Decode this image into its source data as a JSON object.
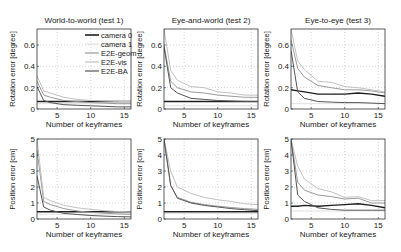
{
  "legend": {
    "entries": [
      {
        "label": "camera 0",
        "color": "#1e1e1e",
        "width": 1.4
      },
      {
        "label": "camera 1",
        "color": "#e0e0e0",
        "width": 1.0
      },
      {
        "label": "E2E-geom",
        "color": "#9a9a9a",
        "width": 1.0
      },
      {
        "label": "E2E-vis",
        "color": "#c2c2c2",
        "width": 1.0
      },
      {
        "label": "E2E-BA",
        "color": "#555555",
        "width": 1.0
      }
    ]
  },
  "chart_data": [
    {
      "type": "line",
      "title": "World-to-world (test 1)",
      "xlabel": "Number of keyframes",
      "ylabel": "Rotation error [degree]",
      "xlim": [
        2,
        16
      ],
      "ylim": [
        0,
        0.75
      ],
      "xticks": [
        5,
        10,
        15
      ],
      "yticks": [
        0,
        0.2,
        0.4,
        0.6
      ],
      "ytick_labels": [
        "0",
        "0.2",
        "0.4",
        "0.6"
      ],
      "grid": true,
      "legend_position": "upper right",
      "x": [
        2,
        3,
        4,
        6,
        8,
        10,
        12,
        14,
        16
      ],
      "series": [
        {
          "name": "camera 0",
          "values": [
            0.07,
            0.07,
            0.07,
            0.07,
            0.07,
            0.07,
            0.07,
            0.07,
            0.07
          ]
        },
        {
          "name": "camera 1",
          "values": [
            0.05,
            0.05,
            0.05,
            0.05,
            0.05,
            0.05,
            0.05,
            0.05,
            0.05
          ]
        },
        {
          "name": "E2E-geom",
          "values": [
            0.26,
            0.13,
            0.11,
            0.08,
            0.07,
            0.06,
            0.055,
            0.05,
            0.05
          ]
        },
        {
          "name": "E2E-vis",
          "values": [
            0.31,
            0.17,
            0.15,
            0.11,
            0.09,
            0.08,
            0.075,
            0.07,
            0.07
          ]
        },
        {
          "name": "E2E-BA",
          "values": [
            0.21,
            0.08,
            0.06,
            0.04,
            0.035,
            0.03,
            0.025,
            0.02,
            0.02
          ]
        }
      ]
    },
    {
      "type": "line",
      "title": "Eye-and-world (test 2)",
      "xlabel": "Number of keyframes",
      "ylabel": "Rotation error [degree]",
      "xlim": [
        2,
        16
      ],
      "ylim": [
        0,
        0.75
      ],
      "xticks": [
        5,
        10,
        15
      ],
      "yticks": [
        0,
        0.2,
        0.4,
        0.6
      ],
      "ytick_labels": [
        "0",
        "0.2",
        "0.4",
        "0.6"
      ],
      "grid": true,
      "x": [
        2,
        3,
        4,
        6,
        8,
        10,
        12,
        14,
        16
      ],
      "series": [
        {
          "name": "camera 0",
          "values": [
            0.07,
            0.07,
            0.07,
            0.07,
            0.07,
            0.07,
            0.07,
            0.07,
            0.07
          ]
        },
        {
          "name": "camera 1",
          "values": [
            0.03,
            0.03,
            0.03,
            0.03,
            0.03,
            0.03,
            0.03,
            0.03,
            0.03
          ]
        },
        {
          "name": "E2E-geom",
          "values": [
            0.6,
            0.26,
            0.2,
            0.16,
            0.15,
            0.13,
            0.12,
            0.11,
            0.11
          ]
        },
        {
          "name": "E2E-vis",
          "values": [
            0.75,
            0.36,
            0.27,
            0.21,
            0.2,
            0.16,
            0.15,
            0.13,
            0.13
          ]
        },
        {
          "name": "E2E-BA",
          "values": [
            0.58,
            0.2,
            0.15,
            0.1,
            0.09,
            0.08,
            0.075,
            0.07,
            0.07
          ]
        }
      ]
    },
    {
      "type": "line",
      "title": "Eye-to-eye (test 3)",
      "xlabel": "Number of keyframes",
      "ylabel": "Rotation error [degree]",
      "xlim": [
        2,
        16
      ],
      "ylim": [
        0,
        0.75
      ],
      "xticks": [
        5,
        10,
        15
      ],
      "yticks": [
        0,
        0.2,
        0.4,
        0.6
      ],
      "ytick_labels": [
        "0",
        "0.2",
        "0.4",
        "0.6"
      ],
      "grid": true,
      "x": [
        2,
        3,
        4,
        6,
        8,
        10,
        12,
        14,
        16
      ],
      "series": [
        {
          "name": "camera 0",
          "values": [
            0.18,
            0.17,
            0.16,
            0.14,
            0.14,
            0.14,
            0.15,
            0.14,
            0.12
          ]
        },
        {
          "name": "camera 1",
          "values": [
            0.05,
            0.05,
            0.05,
            0.05,
            0.05,
            0.05,
            0.05,
            0.05,
            0.05
          ]
        },
        {
          "name": "E2E-geom",
          "values": [
            0.65,
            0.38,
            0.3,
            0.22,
            0.2,
            0.18,
            0.18,
            0.17,
            0.15
          ]
        },
        {
          "name": "E2E-vis",
          "values": [
            0.75,
            0.45,
            0.37,
            0.26,
            0.25,
            0.21,
            0.2,
            0.18,
            0.16
          ]
        },
        {
          "name": "E2E-BA",
          "values": [
            0.55,
            0.16,
            0.1,
            0.07,
            0.065,
            0.06,
            0.06,
            0.055,
            0.05
          ]
        }
      ]
    },
    {
      "type": "line",
      "title": "",
      "xlabel": "Number of keyframes",
      "ylabel": "Position error [cm]",
      "xlim": [
        2,
        16
      ],
      "ylim": [
        0,
        5
      ],
      "xticks": [
        5,
        10,
        15
      ],
      "yticks": [
        0,
        1,
        2,
        3,
        4,
        5
      ],
      "ytick_labels": [
        "0",
        "1",
        "2",
        "3",
        "4",
        "5"
      ],
      "grid": true,
      "x": [
        2,
        3,
        4,
        6,
        8,
        10,
        12,
        14,
        16
      ],
      "series": [
        {
          "name": "camera 0",
          "values": [
            0.45,
            0.45,
            0.45,
            0.45,
            0.45,
            0.45,
            0.45,
            0.45,
            0.45
          ]
        },
        {
          "name": "camera 1",
          "values": [
            0.3,
            0.3,
            0.3,
            0.3,
            0.3,
            0.3,
            0.3,
            0.3,
            0.3
          ]
        },
        {
          "name": "E2E-geom",
          "values": [
            4.3,
            1.1,
            0.9,
            0.65,
            0.5,
            0.42,
            0.36,
            0.32,
            0.3
          ]
        },
        {
          "name": "E2E-vis",
          "values": [
            5.0,
            1.35,
            1.15,
            0.85,
            0.7,
            0.6,
            0.52,
            0.47,
            0.45
          ]
        },
        {
          "name": "E2E-BA",
          "values": [
            2.7,
            0.75,
            0.55,
            0.35,
            0.28,
            0.22,
            0.18,
            0.15,
            0.13
          ]
        }
      ]
    },
    {
      "type": "line",
      "title": "",
      "xlabel": "Number of keyframes",
      "ylabel": "Position error [cm]",
      "xlim": [
        2,
        16
      ],
      "ylim": [
        0,
        5
      ],
      "xticks": [
        5,
        10,
        15
      ],
      "yticks": [
        0,
        1,
        2,
        3,
        4,
        5
      ],
      "ytick_labels": [
        "0",
        "1",
        "2",
        "3",
        "4",
        "5"
      ],
      "grid": true,
      "x": [
        2,
        3,
        4,
        6,
        8,
        10,
        12,
        14,
        16
      ],
      "series": [
        {
          "name": "camera 0",
          "values": [
            0.45,
            0.45,
            0.45,
            0.45,
            0.45,
            0.45,
            0.45,
            0.45,
            0.45
          ]
        },
        {
          "name": "camera 1",
          "values": [
            0.35,
            0.35,
            0.35,
            0.35,
            0.35,
            0.35,
            0.35,
            0.35,
            0.35
          ]
        },
        {
          "name": "E2E-geom",
          "values": [
            5.0,
            2.1,
            1.35,
            1.05,
            0.9,
            0.8,
            0.72,
            0.65,
            0.6
          ]
        },
        {
          "name": "E2E-vis",
          "values": [
            5.0,
            3.0,
            2.0,
            1.6,
            1.35,
            1.2,
            1.1,
            0.95,
            0.9
          ]
        },
        {
          "name": "E2E-BA",
          "values": [
            5.0,
            2.1,
            1.3,
            1.0,
            0.85,
            0.75,
            0.65,
            0.58,
            0.52
          ]
        }
      ]
    },
    {
      "type": "line",
      "title": "",
      "xlabel": "Number of keyframes",
      "ylabel": "Position error [cm]",
      "xlim": [
        2,
        16
      ],
      "ylim": [
        0,
        5
      ],
      "xticks": [
        5,
        10,
        15
      ],
      "yticks": [
        0,
        1,
        2,
        3,
        4,
        5
      ],
      "ytick_labels": [
        "0",
        "1",
        "2",
        "3",
        "4",
        "5"
      ],
      "grid": true,
      "x": [
        2,
        3,
        4,
        6,
        8,
        10,
        12,
        14,
        16
      ],
      "series": [
        {
          "name": "camera 0",
          "values": [
            0.8,
            0.8,
            0.85,
            0.8,
            0.85,
            0.9,
            0.95,
            0.85,
            0.7
          ]
        },
        {
          "name": "camera 1",
          "values": [
            0.5,
            0.5,
            0.5,
            0.5,
            0.5,
            0.5,
            0.5,
            0.5,
            0.5
          ]
        },
        {
          "name": "E2E-geom",
          "values": [
            5.0,
            2.3,
            1.8,
            1.5,
            1.4,
            1.25,
            1.3,
            1.0,
            1.0
          ]
        },
        {
          "name": "E2E-vis",
          "values": [
            5.0,
            3.3,
            2.5,
            1.9,
            1.7,
            1.35,
            1.4,
            1.15,
            1.15
          ]
        },
        {
          "name": "E2E-BA",
          "values": [
            5.0,
            1.5,
            1.1,
            0.7,
            0.6,
            0.55,
            0.55,
            0.55,
            0.55
          ]
        }
      ]
    }
  ]
}
